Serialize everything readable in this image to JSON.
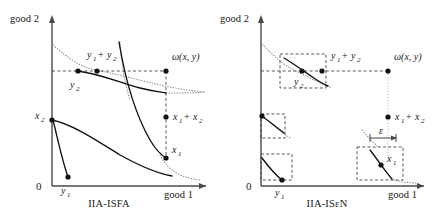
{
  "figure": {
    "panels": [
      {
        "id": "left",
        "caption": "IIA-ISFA",
        "axes": {
          "x_label": "good 1",
          "y_label": "good 2",
          "origin_label": "0"
        },
        "points": [
          {
            "name": "y2",
            "base": "y",
            "sub": "2",
            "op": ""
          },
          {
            "name": "y1y2",
            "base": "y",
            "sub": "1",
            "op": " + ",
            "base2": "y",
            "sub2": "2"
          },
          {
            "name": "omega",
            "base": "ω(x, y)"
          },
          {
            "name": "x1x2",
            "base": "x",
            "sub": "1",
            "op": " + ",
            "base2": "x",
            "sub2": "2"
          },
          {
            "name": "x1",
            "base": "x",
            "sub": "1"
          },
          {
            "name": "x2",
            "base": "x",
            "sub": "2"
          },
          {
            "name": "y1",
            "base": "y",
            "sub": "1"
          }
        ]
      },
      {
        "id": "right",
        "caption": "IIA-ISεN",
        "axes": {
          "x_label": "good 1",
          "y_label": "good 2",
          "origin_label": "0"
        },
        "epsilon_label": "ε",
        "points": [
          {
            "name": "y2",
            "base": "y",
            "sub": "2",
            "op": ""
          },
          {
            "name": "y1y2",
            "base": "y",
            "sub": "1",
            "op": " + ",
            "base2": "y",
            "sub2": "2"
          },
          {
            "name": "omega",
            "base": "ω(x, y)"
          },
          {
            "name": "x1x2",
            "base": "x",
            "sub": "1",
            "op": " + ",
            "base2": "x",
            "sub2": "2"
          },
          {
            "name": "x1",
            "base": "x",
            "sub": "1"
          },
          {
            "name": "y1",
            "base": "y",
            "sub": "1"
          }
        ]
      }
    ],
    "labels": {
      "good1": "good 1",
      "good2": "good 2",
      "zero": "0",
      "omega": "ω(x, y)",
      "epsilon": "ε",
      "y": "y",
      "x": "x",
      "plus": "+",
      "one": "1",
      "two": "2",
      "caption_left": "IIA-ISFA",
      "caption_right": "IIA-ISεN"
    },
    "colors": {
      "axis": "#4a4a4a",
      "curve": "#111111",
      "dotted": "#8a8a8a",
      "dashed": "#3a3a3a",
      "text": "#1a1a1a",
      "background": "#ffffff"
    }
  }
}
